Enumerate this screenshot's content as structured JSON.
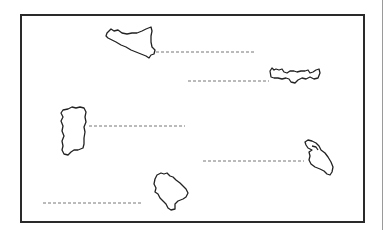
{
  "worksheet": {
    "type": "label-the-islands",
    "frame": {
      "border_color": "#2a2a2a",
      "background": "#ffffff"
    },
    "islands": [
      {
        "name": "island-1",
        "shape": "sicily-like",
        "label": ""
      },
      {
        "name": "island-2",
        "shape": "crete-like",
        "label": ""
      },
      {
        "name": "island-3",
        "shape": "sardinia-like",
        "label": ""
      },
      {
        "name": "island-4",
        "shape": "rhodes-like",
        "label": ""
      },
      {
        "name": "island-5",
        "shape": "mallorca-like",
        "label": ""
      }
    ],
    "answer_lines": 5,
    "line_style": "dashed",
    "line_color": "#777777",
    "outline_color": "#222222"
  }
}
